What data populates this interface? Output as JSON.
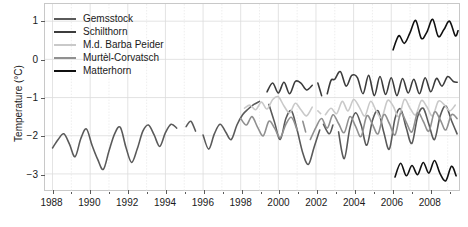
{
  "chart_data": {
    "type": "line",
    "title": "",
    "xlabel": "",
    "ylabel": "Temperature (°C)",
    "xlim": [
      1987.6,
      2009.6
    ],
    "ylim": [
      -3.45,
      1.45
    ],
    "xticks": [
      1988,
      1990,
      1992,
      1994,
      1996,
      1998,
      2000,
      2002,
      2004,
      2006,
      2008
    ],
    "xtick_labels": [
      "1988",
      "1990",
      "1992",
      "1994",
      "1996",
      "1998",
      "2000",
      "2002",
      "2004",
      "2006",
      "2008"
    ],
    "xminor_ticks": [
      1989,
      1991,
      1993,
      1995,
      1997,
      1999,
      2001,
      2003,
      2005,
      2007,
      2009
    ],
    "yticks": [
      1,
      0,
      -1,
      -2,
      -3
    ],
    "ytick_labels": [
      "1",
      "0",
      "−1",
      "−2",
      "−3"
    ],
    "grid": true,
    "grid_major_color": "#dcdcdc",
    "grid_minor_color": "#e9e9e9",
    "legend_position": "top-left",
    "background": "#ffffff",
    "frame_color": "#c8c8c8",
    "series": [
      {
        "name": "Gemsstock",
        "color": "#5a5a5a",
        "segments": [
          {
            "x": [
              1988.0,
              1988.3,
              1988.6,
              1988.9,
              1989.2,
              1989.5,
              1989.8,
              1990.1,
              1990.4,
              1990.7,
              1991.0,
              1991.3,
              1991.6,
              1991.9,
              1992.2,
              1992.5,
              1992.8,
              1993.1,
              1993.4,
              1993.7,
              1994.0,
              1994.3,
              1994.6
            ],
            "y": [
              -2.32,
              -2.1,
              -1.95,
              -2.22,
              -2.55,
              -2.08,
              -1.82,
              -2.25,
              -2.62,
              -2.88,
              -2.4,
              -1.95,
              -1.78,
              -2.3,
              -2.7,
              -2.35,
              -1.88,
              -1.72,
              -1.98,
              -2.28,
              -1.92,
              -1.7,
              -1.8
            ]
          },
          {
            "x": [
              1995.1,
              1995.35,
              1995.6
            ],
            "y": [
              -1.76,
              -1.62,
              -1.88
            ]
          },
          {
            "x": [
              1996.0,
              1996.3,
              1996.6,
              1996.9,
              1997.2,
              1997.5,
              1997.8,
              1998.1,
              1998.4,
              1998.7,
              1999.0
            ],
            "y": [
              -1.98,
              -2.35,
              -1.95,
              -1.7,
              -1.9,
              -2.1,
              -1.72,
              -1.45,
              -1.3,
              -1.18,
              -1.1
            ]
          },
          {
            "x": [
              1999.5,
              1999.8,
              2000.1,
              2000.4,
              2000.7,
              2001.0,
              2001.3,
              2001.6,
              2001.9,
              2002.2
            ],
            "y": [
              -1.18,
              -1.65,
              -2.1,
              -1.55,
              -1.35,
              -1.85,
              -2.45,
              -2.75,
              -2.3,
              -1.85
            ]
          },
          {
            "x": [
              2002.4,
              2002.7,
              2002.9
            ],
            "y": [
              -1.7,
              -1.95,
              -1.72
            ]
          },
          {
            "x": [
              2003.2,
              2003.5,
              2003.8,
              2004.1,
              2004.4,
              2004.7,
              2005.0,
              2005.3,
              2005.6,
              2005.9,
              2006.2,
              2006.5,
              2006.8,
              2007.1,
              2007.4,
              2007.7,
              2008.0,
              2008.3,
              2008.6,
              2008.9,
              2009.2,
              2009.5
            ],
            "y": [
              -1.9,
              -2.6,
              -1.8,
              -1.4,
              -1.72,
              -2.25,
              -1.6,
              -1.35,
              -1.9,
              -2.35,
              -1.55,
              -1.3,
              -1.8,
              -2.2,
              -1.5,
              -1.28,
              -1.7,
              -2.1,
              -1.48,
              -1.22,
              -1.6,
              -1.95
            ]
          }
        ]
      },
      {
        "name": "Schilthorn",
        "color": "#3c3c3c",
        "segments": [
          {
            "x": [
              1999.4,
              1999.7,
              2000.0,
              2000.3,
              2000.6,
              2000.9,
              2001.2,
              2001.5,
              2001.8
            ],
            "y": [
              -0.85,
              -0.62,
              -0.88,
              -0.6,
              -0.9,
              -0.58,
              -0.62,
              -0.8,
              -0.68
            ]
          },
          {
            "x": [
              2002.1,
              2002.3
            ],
            "y": [
              -0.62,
              -0.95
            ]
          },
          {
            "x": [
              2002.6,
              2002.8,
              2003.0,
              2003.3,
              2003.6,
              2003.9,
              2004.2,
              2004.5,
              2004.8,
              2005.1,
              2005.4,
              2005.7,
              2006.0,
              2006.3,
              2006.6,
              2006.9,
              2007.2,
              2007.5,
              2007.8,
              2008.1,
              2008.4,
              2008.7,
              2009.0,
              2009.3,
              2009.5
            ],
            "y": [
              -0.9,
              -0.55,
              -0.52,
              -0.32,
              -0.7,
              -0.42,
              -0.48,
              -0.9,
              -0.42,
              -0.95,
              -0.45,
              -0.92,
              -0.48,
              -0.95,
              -0.5,
              -0.88,
              -0.52,
              -0.9,
              -0.48,
              -0.85,
              -0.5,
              -0.7,
              -0.45,
              -0.58,
              -0.6
            ]
          }
        ]
      },
      {
        "name": "M.d. Barba Peider",
        "color": "#c9c9c9",
        "segments": [
          {
            "x": [
              1998.2,
              1998.5,
              1998.8,
              1999.1,
              1999.4,
              1999.7,
              2000.0,
              2000.3,
              2000.6,
              2000.9,
              2001.2,
              2001.5,
              2001.8
            ],
            "y": [
              -1.28,
              -1.2,
              -1.32,
              -1.12,
              -1.3,
              -1.05,
              -0.98,
              -1.22,
              -1.4,
              -1.15,
              -1.32,
              -1.48,
              -1.25
            ]
          },
          {
            "x": [
              2002.1,
              2002.25
            ],
            "y": [
              -1.35,
              -1.42
            ]
          },
          {
            "x": [
              2002.5,
              2002.8,
              2003.1,
              2003.4,
              2003.7,
              2004.0,
              2004.3,
              2004.6,
              2004.9,
              2005.2,
              2005.5,
              2005.8,
              2006.1,
              2006.4,
              2006.7,
              2007.0,
              2007.3,
              2007.6,
              2007.9,
              2008.2,
              2008.5,
              2008.8,
              2009.1,
              2009.4
            ],
            "y": [
              -1.45,
              -1.28,
              -1.42,
              -1.1,
              -1.35,
              -1.05,
              -1.25,
              -1.48,
              -1.1,
              -1.35,
              -1.52,
              -1.08,
              -1.22,
              -1.5,
              -1.05,
              -1.28,
              -1.45,
              -1.08,
              -1.25,
              -1.48,
              -1.1,
              -1.18,
              -1.35,
              -1.2
            ]
          }
        ]
      },
      {
        "name": "Murtèl-Corvatsch",
        "color": "#909090",
        "segments": [
          {
            "x": [
              1998.0,
              1998.3,
              1998.6,
              1998.9,
              1999.2,
              1999.5,
              1999.8,
              2000.1,
              2000.4,
              2000.7,
              2001.0
            ],
            "y": [
              -1.55,
              -1.72,
              -1.5,
              -1.78,
              -2.0,
              -1.62,
              -1.8,
              -2.05,
              -1.7,
              -1.52,
              -1.85
            ]
          },
          {
            "x": [
              2001.3,
              2001.45
            ],
            "y": [
              -1.62,
              -1.9
            ]
          },
          {
            "x": [
              2001.7,
              2002.0,
              2002.3,
              2002.6,
              2002.9,
              2003.2,
              2003.5,
              2003.8,
              2004.1,
              2004.4,
              2004.7,
              2005.0,
              2005.3,
              2005.6,
              2005.9,
              2006.2,
              2006.5,
              2006.8,
              2007.1,
              2007.4,
              2007.7,
              2008.0,
              2008.3,
              2008.6,
              2008.9,
              2009.2,
              2009.5
            ],
            "y": [
              -2.1,
              -1.78,
              -1.55,
              -1.8,
              -1.45,
              -1.68,
              -1.92,
              -1.5,
              -1.75,
              -2.02,
              -1.48,
              -1.7,
              -1.95,
              -1.45,
              -1.68,
              -1.98,
              -1.42,
              -1.65,
              -1.9,
              -1.4,
              -1.62,
              -1.88,
              -1.38,
              -1.58,
              -1.85,
              -1.45,
              -1.55
            ]
          }
        ]
      },
      {
        "name": "Matterhorn",
        "color": "#101010",
        "segments": [
          {
            "x": [
              2006.1,
              2006.4,
              2006.7,
              2007.0,
              2007.3,
              2007.6,
              2007.9,
              2008.2,
              2008.5,
              2008.8,
              2009.1,
              2009.4,
              2009.55
            ],
            "y": [
              0.25,
              0.62,
              0.42,
              0.7,
              1.02,
              0.55,
              0.72,
              1.05,
              0.6,
              0.78,
              1.0,
              0.62,
              0.75
            ]
          },
          {
            "x": [
              2006.2,
              2006.5,
              2006.8,
              2007.1,
              2007.4,
              2007.7,
              2008.0,
              2008.3,
              2008.6,
              2008.9,
              2009.2,
              2009.45
            ],
            "y": [
              -3.08,
              -2.72,
              -3.05,
              -2.78,
              -3.02,
              -2.7,
              -2.98,
              -2.65,
              -3.0,
              -3.18,
              -2.8,
              -3.05
            ]
          }
        ]
      }
    ]
  },
  "legend": {
    "entries": [
      {
        "label": "Gemsstock",
        "color": "#5a5a5a"
      },
      {
        "label": "Schilthorn",
        "color": "#3c3c3c"
      },
      {
        "label": "M.d. Barba Peider",
        "color": "#c9c9c9"
      },
      {
        "label": "Murtèl-Corvatsch",
        "color": "#909090"
      },
      {
        "label": "Matterhorn",
        "color": "#101010"
      }
    ]
  }
}
